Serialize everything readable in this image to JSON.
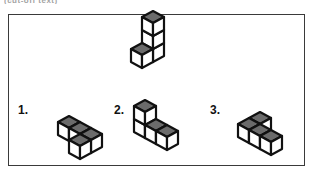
{
  "caption_clipped": "(cut-off text)",
  "panel": {
    "border_color": "#3a3a3a",
    "background": "#ffffff"
  },
  "style": {
    "cube_outline": "#111111",
    "cube_top_face": "#6b6b6b",
    "cube_left_face": "#ffffff",
    "cube_right_face": "#ffffff",
    "stroke_width": 2.2,
    "cube_half_width": 11,
    "cube_half_height": 6,
    "cube_side_height": 13
  },
  "reference_figure": {
    "name": "reference-solid",
    "label": "",
    "cube_count": 4,
    "description": "Vertical stack of three cubes with one cube attached at the front-left of the bottom level",
    "origin": {
      "x": 152,
      "y": 36
    },
    "cells": [
      {
        "x": 0,
        "y": 0,
        "z": 2
      },
      {
        "x": 0,
        "y": 0,
        "z": 1
      },
      {
        "x": 0,
        "y": 0,
        "z": 0
      },
      {
        "x": 0,
        "y": 1,
        "z": 0
      }
    ]
  },
  "options": [
    {
      "name": "option-1",
      "label": "1.",
      "label_pos": {
        "x": 17,
        "y": 103
      },
      "cube_count": 4,
      "description": "L-shaped flat arrangement: row of two along one axis plus two stepping toward the viewer",
      "origin": {
        "x": 68,
        "y": 115
      },
      "cells": [
        {
          "x": 0,
          "y": 0,
          "z": 0
        },
        {
          "x": 1,
          "y": 0,
          "z": 0
        },
        {
          "x": 2,
          "y": 0,
          "z": 0
        },
        {
          "x": 2,
          "y": 1,
          "z": 0
        }
      ]
    },
    {
      "name": "option-2",
      "label": "2.",
      "label_pos": {
        "x": 113,
        "y": 103
      },
      "cube_count": 4,
      "description": "Vertical pair at the left with a horizontal row of two extending to the right",
      "origin": {
        "x": 144,
        "y": 112
      },
      "cells": [
        {
          "x": 0,
          "y": 0,
          "z": 1
        },
        {
          "x": 0,
          "y": 0,
          "z": 0
        },
        {
          "x": 1,
          "y": 0,
          "z": 0
        },
        {
          "x": 2,
          "y": 0,
          "z": 0
        }
      ]
    },
    {
      "name": "option-3",
      "label": "3.",
      "label_pos": {
        "x": 209,
        "y": 103
      },
      "cube_count": 4,
      "description": "Row of three cubes with one cube set back behind the left end",
      "origin": {
        "x": 248,
        "y": 117
      },
      "cells": [
        {
          "x": 0,
          "y": 0,
          "z": 0
        },
        {
          "x": 1,
          "y": 0,
          "z": 0
        },
        {
          "x": 2,
          "y": 0,
          "z": 0
        },
        {
          "x": 0,
          "y": -1,
          "z": 0
        }
      ]
    }
  ]
}
